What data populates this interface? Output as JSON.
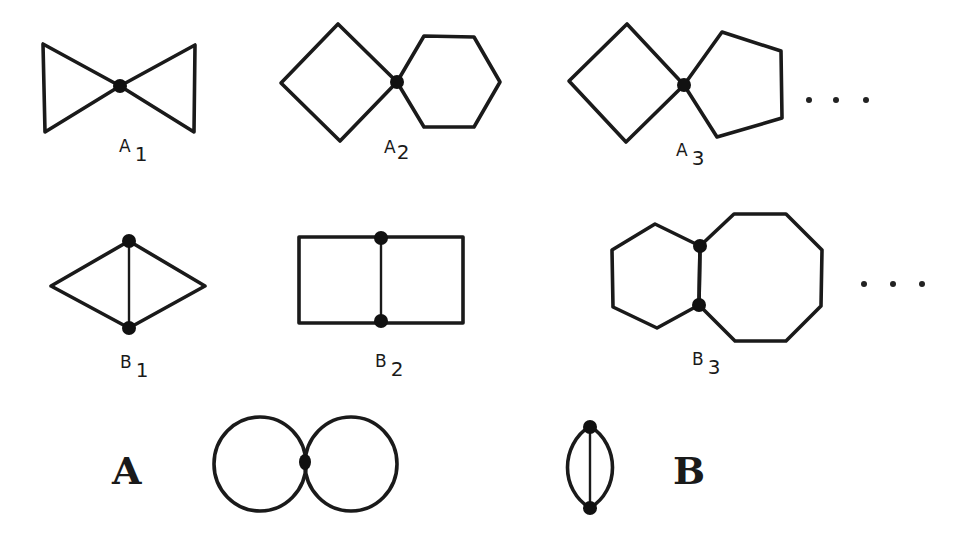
{
  "figure": {
    "row_a": {
      "items": [
        {
          "id": "A1",
          "letter": "A",
          "sub": "1",
          "description": "two triangles joined at a vertex"
        },
        {
          "id": "A2",
          "letter": "A",
          "sub": "2",
          "description": "square and hexagon joined at a vertex"
        },
        {
          "id": "A3",
          "letter": "A",
          "sub": "3",
          "description": "square and pentagon joined at a vertex"
        }
      ],
      "ellipsis": "..."
    },
    "row_b": {
      "items": [
        {
          "id": "B1",
          "letter": "B",
          "sub": "1",
          "description": "two triangles sharing an edge"
        },
        {
          "id": "B2",
          "letter": "B",
          "sub": "2",
          "description": "two squares sharing an edge"
        },
        {
          "id": "B3",
          "letter": "B",
          "sub": "3",
          "description": "hexagon and octagon sharing an edge"
        }
      ],
      "ellipsis": "..."
    },
    "limits": {
      "A": {
        "label": "A",
        "description": "two circles touching at a point"
      },
      "B": {
        "label": "B",
        "description": "theta graph: two vertices joined by three arcs"
      }
    },
    "colors": {
      "stroke": "#1a1a1a",
      "background": "#ffffff"
    }
  }
}
